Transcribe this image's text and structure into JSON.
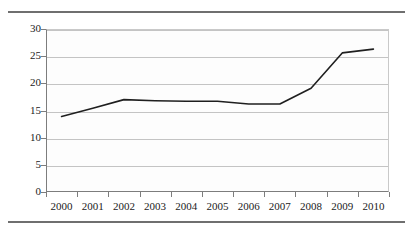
{
  "chart_data": {
    "type": "line",
    "title": "",
    "subtitle": "",
    "xlabel": "",
    "ylabel": "",
    "categories": [
      "2000",
      "2001",
      "2002",
      "2003",
      "2004",
      "2005",
      "2006",
      "2007",
      "2008",
      "2009",
      "2010"
    ],
    "values": [
      13.9,
      15.4,
      17.0,
      16.8,
      16.7,
      16.7,
      16.2,
      16.2,
      19.1,
      25.6,
      26.3
    ],
    "series": [
      {
        "name": "series-1",
        "values": [
          13.9,
          15.4,
          17.0,
          16.8,
          16.7,
          16.7,
          16.2,
          16.2,
          19.1,
          25.6,
          26.3
        ],
        "color": "#1f1f1f"
      }
    ],
    "ylim": [
      0,
      30
    ],
    "yticks": [
      "0",
      "5",
      "10",
      "15",
      "20",
      "25",
      "30"
    ],
    "ytick_values": [
      0,
      5,
      10,
      15,
      20,
      25,
      30
    ],
    "grid": true,
    "grid_axis": "y",
    "legend": false,
    "legend_position": "none",
    "markers": false,
    "line_width": 1.6
  },
  "figure": {
    "background_color": "#ffffff",
    "plot_background_color": "#fdfdfd",
    "gridline_color": "#c4c4c4",
    "axis_color": "#7d7d7d",
    "label_color": "#1b1b1b",
    "rule_color": "#6f6f6f"
  },
  "rules": {
    "top_label": "top-divider",
    "bottom_label": "bottom-divider"
  }
}
